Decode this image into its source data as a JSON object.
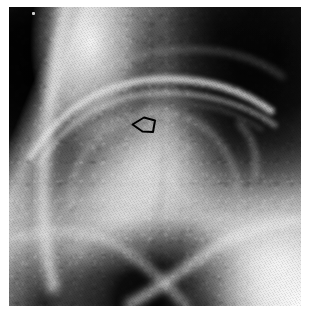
{
  "figure": {
    "name": "hip-radiograph",
    "modality": "plain radiograph",
    "anatomy": "hip joint",
    "view": "anteroposterior-oblique",
    "caption": ""
  },
  "canvas": {
    "width_px": 313,
    "height_px": 318,
    "film_left_px": 9,
    "film_top_px": 7,
    "film_width_px": 292,
    "film_height_px": 299,
    "background_color": "#ffffff"
  },
  "palette": {
    "film_border": "#ffffff",
    "darkest_shadow": "#1a1a1a",
    "dark_soft_tissue": "#2e2e2e",
    "mid_gray": "#8a8a8a",
    "bone_gray": "#a8a8a8",
    "bright_cortex": "#e4e4e4",
    "brightest": "#f2f2f2",
    "marker_outline": "#000000"
  },
  "regions": [
    {
      "id": "dark-upper-left",
      "label": "Dark soft-tissue shadow, upper left",
      "center_pct": [
        9,
        24
      ],
      "tone": "#1a1a1a"
    },
    {
      "id": "bright-left-rim",
      "label": "Bright cortical margin of iliac wing",
      "center_pct": [
        28,
        12
      ],
      "tone": "#e4e4e4"
    },
    {
      "id": "dark-upper-right",
      "label": "Dark shadow, upper right",
      "center_pct": [
        92,
        16
      ],
      "tone": "#222222"
    },
    {
      "id": "acetabular-arch",
      "label": "Bright acetabular roof arch",
      "center_pct": [
        48,
        30
      ],
      "tone": "#d6d6d6"
    },
    {
      "id": "femoral-head",
      "label": "Femoral head, mottled trabecular bone",
      "center_pct": [
        44,
        52
      ],
      "tone": "#b4b4b4"
    },
    {
      "id": "dark-bottom-centre",
      "label": "Dark obturator foramen, bottom centre",
      "center_pct": [
        52,
        98
      ],
      "tone": "#141414"
    },
    {
      "id": "bright-lower-right",
      "label": "Bright pubic ramus and lower-right corner",
      "center_pct": [
        92,
        86
      ],
      "tone": "#f0f0f0"
    }
  ],
  "marker": {
    "id": "lesion-marker",
    "shape": "open arrowhead",
    "filled": false,
    "stroke_color": "#000000",
    "stroke_width_px": 2,
    "points_toward": "upper-left",
    "position_px": [
      128,
      110
    ],
    "size_px": [
      40,
      34
    ],
    "annotates": "subchondral focus in the superior femoral head"
  },
  "artifacts": [
    {
      "id": "film-speck",
      "label": "Bright film speck artifact",
      "position_px": [
        32,
        12
      ],
      "size_px": [
        3,
        3
      ]
    }
  ]
}
